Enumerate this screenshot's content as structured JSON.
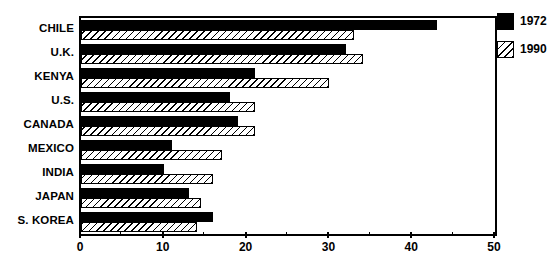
{
  "chart_data": {
    "type": "bar",
    "orientation": "horizontal",
    "title": "",
    "subtitle": "",
    "xlabel": "",
    "ylabel": "",
    "xlim": [
      0,
      50
    ],
    "xticks": [
      0,
      10,
      20,
      30,
      40,
      50
    ],
    "xtick_labels": [
      "0",
      "10",
      "20",
      "30",
      "40",
      "50"
    ],
    "minor_tick_step": 5,
    "grid": false,
    "legend_position": "right-top",
    "categories": [
      "CHILE",
      "U.K.",
      "KENYA",
      "U.S.",
      "CANADA",
      "MEXICO",
      "INDIA",
      "JAPAN",
      "S. KOREA"
    ],
    "series": [
      {
        "name": "1972",
        "fill": "solid-black",
        "color": "#000000",
        "values": [
          43,
          32,
          21,
          18,
          19,
          11,
          10,
          13,
          16
        ]
      },
      {
        "name": "1990",
        "fill": "diagonal-hatch",
        "color": "#ffffff",
        "values": [
          33,
          34,
          30,
          21,
          21,
          17,
          16,
          14.5,
          14
        ]
      }
    ]
  },
  "legend": {
    "entries": [
      {
        "label": "1972",
        "swatch": "solid-black-swatch"
      },
      {
        "label": "1990",
        "swatch": "hatched-swatch"
      }
    ]
  },
  "colors": {
    "ink": "#000000",
    "paper": "#ffffff"
  }
}
